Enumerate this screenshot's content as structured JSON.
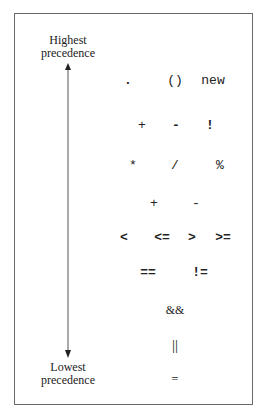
{
  "diagram": {
    "title_top": [
      "Highest",
      "precedence"
    ],
    "title_bottom": [
      "Lowest",
      "precedence"
    ],
    "colors": {
      "border": "#6a6a6a",
      "text": "#222222",
      "arrow": "#333333"
    },
    "rows": [
      {
        "ops": [
          ".",
          "()",
          "new"
        ]
      },
      {
        "ops": [
          "+",
          "-",
          "!"
        ]
      },
      {
        "ops": [
          "*",
          "/",
          "%"
        ]
      },
      {
        "ops": [
          "+",
          "-"
        ]
      },
      {
        "ops": [
          "<",
          "<=",
          ">",
          ">="
        ]
      },
      {
        "ops": [
          "==",
          "!="
        ]
      },
      {
        "ops": [
          "&&"
        ]
      },
      {
        "ops": [
          "||"
        ]
      },
      {
        "ops": [
          "="
        ]
      }
    ]
  }
}
